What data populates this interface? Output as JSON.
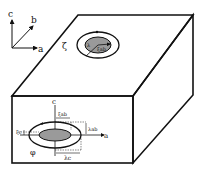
{
  "axes": {
    "c": "c",
    "b": "b",
    "a": "a"
  },
  "top_face": {
    "zeta": "ζ",
    "inner_lambda": "λ",
    "inner_xi": "ξab"
  },
  "front_face": {
    "axis_c": "c",
    "axis_a": "a",
    "xi_ab": "ξab",
    "lambda_ab": "λab",
    "xi_c": "ξc",
    "lambda_c": "λc",
    "phi": "φ"
  },
  "colors": {
    "line": "#111111",
    "inner_fill": "#9a9a9a",
    "background": "#ffffff"
  }
}
